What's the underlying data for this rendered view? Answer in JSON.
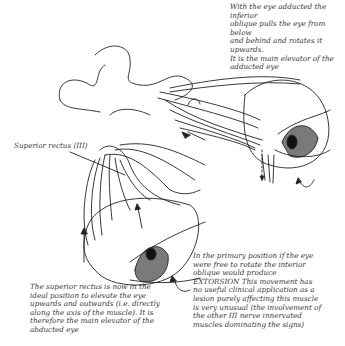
{
  "diagram": {
    "captions": {
      "top_right": "With the eye adducted the inferior\noblique pulls the eye from below\nand behind and rotates it upwards.\nIt is the main elevator of the\nadducted eye",
      "label_superior_rectus": "Superior rectus (III)",
      "bottom_left": "The superior rectus is now in the\nideal position to elevate the eye\nupwards and outwards (i.e. directly\nalong the axis of the muscle).  It is\ntherefore the main elevator of the\nabducted eye",
      "bottom_right": "In the primary position if the eye\nwere free to rotate the interior\noblique would produce\nEXTORSION   This movement has\nno useful clinical application as a\nlesion purely affecting this muscle\nis very unusual (the involvement of\nthe other III nerve innervated\nmuscles dominating the signs)"
    },
    "colors": {
      "line": "#222222",
      "iris": "#7a7a7a",
      "pupil": "#111111",
      "background": "#ffffff"
    }
  }
}
